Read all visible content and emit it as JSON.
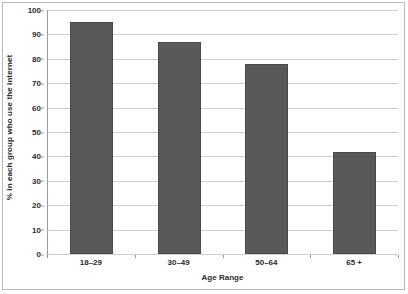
{
  "chart_data": {
    "type": "bar",
    "title": "",
    "categories": [
      "18–29",
      "30–49",
      "50–64",
      "65 +"
    ],
    "values": [
      95,
      87,
      78,
      42
    ],
    "series": [
      {
        "name": "% in each group who use the internet",
        "values": [
          95,
          87,
          78,
          42
        ]
      }
    ],
    "xlabel": "Age Range",
    "ylabel": "% in each group who use the internet",
    "ylim": [
      0,
      100
    ],
    "yticks": [
      0,
      10,
      20,
      30,
      40,
      50,
      60,
      70,
      80,
      90,
      100
    ],
    "ytick_labels": [
      "0",
      "10",
      "20",
      "30",
      "40",
      "50",
      "60",
      "70",
      "80",
      "90",
      "100"
    ],
    "grid": true,
    "legend": false,
    "bar_color": "#595959",
    "gridline_color": "#cfcfcf",
    "axis_color": "#7f7f7f",
    "background_color": "#ffffff",
    "text_color": "#2b2b2b"
  }
}
